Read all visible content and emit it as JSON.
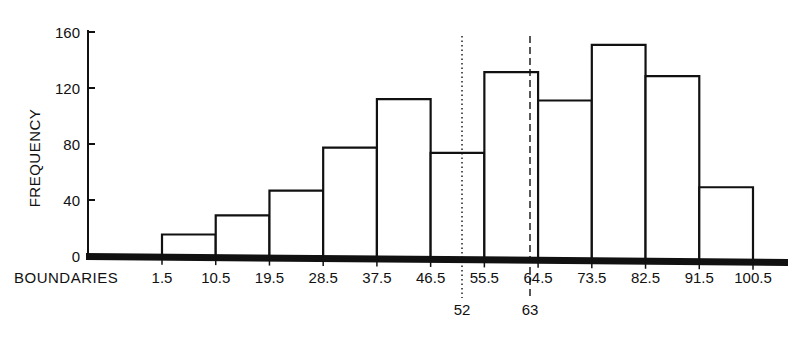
{
  "chart_data": {
    "type": "bar",
    "subtype": "histogram",
    "title": "",
    "xlabel": "BOUNDARIES",
    "ylabel": "FREQUENCY",
    "ylim": [
      0,
      160
    ],
    "yticks": [
      0,
      40,
      80,
      120,
      160
    ],
    "boundaries": [
      1.5,
      10.5,
      19.5,
      28.5,
      37.5,
      46.5,
      55.5,
      64.5,
      73.5,
      82.5,
      91.5,
      100.5
    ],
    "boundary_labels": [
      "1.5",
      "10.5",
      "19.5",
      "28.5",
      "37.5",
      "46.5",
      "55.5",
      "64.5",
      "73.5",
      "82.5",
      "91.5",
      "100.5"
    ],
    "categories": [
      "1.5-10.5",
      "10.5-19.5",
      "19.5-28.5",
      "28.5-37.5",
      "37.5-46.5",
      "46.5-55.5",
      "55.5-64.5",
      "64.5-73.5",
      "73.5-82.5",
      "82.5-91.5",
      "91.5-100.5"
    ],
    "values": [
      16,
      30,
      48,
      79,
      114,
      76,
      134,
      114,
      154,
      132,
      53
    ],
    "reference_lines": [
      {
        "x": 52,
        "label": "52",
        "style": "dotted"
      },
      {
        "x": 63,
        "label": "63",
        "style": "dashed"
      }
    ],
    "grid": false,
    "legend": null
  },
  "labels": {
    "y_axis_title": "FREQUENCY",
    "x_axis_title": "BOUNDARIES",
    "y_ticks": [
      "0",
      "40",
      "80",
      "120",
      "160"
    ],
    "ref_line_1": "52",
    "ref_line_2": "63"
  }
}
